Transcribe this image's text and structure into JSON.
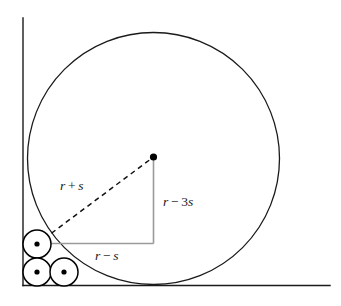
{
  "figure": {
    "background_color": "#ffffff",
    "width": 341,
    "height": 306,
    "axes": {
      "stroke_color": "#1a1a1a",
      "stroke_width": 1.4,
      "vertical": {
        "x": 23,
        "y_top": 18,
        "y_bottom": 285.5
      },
      "horizontal": {
        "y": 285.5,
        "x_left": 23,
        "x_right": 330
      }
    },
    "big_circle": {
      "name": "large-circle",
      "cx": 153.5,
      "cy": 158.5,
      "r": 126,
      "stroke_color": "#1a1a1a",
      "stroke_width": 1.3,
      "fill": "none"
    },
    "big_circle_center_dot": {
      "cx": 153.5,
      "cy": 157,
      "r": 3.6,
      "fill": "#000000"
    },
    "small_circles": [
      {
        "name": "small-circle-upper-left",
        "cx": 37,
        "cy": 244,
        "r": 14,
        "dot_r": 2.6
      },
      {
        "name": "small-circle-lower-left",
        "cx": 37,
        "cy": 272,
        "r": 14,
        "dot_r": 2.6
      },
      {
        "name": "small-circle-lower-right",
        "cx": 64,
        "cy": 272,
        "r": 14,
        "dot_r": 2.6
      }
    ],
    "small_circle_style": {
      "stroke_color": "#000000",
      "stroke_width": 1.5,
      "fill": "#ffffff",
      "dot_fill": "#000000"
    },
    "hypotenuse": {
      "name": "dashed-hypotenuse",
      "x1": 37,
      "y1": 244,
      "x2": 153.5,
      "y2": 157,
      "stroke_color": "#111111",
      "stroke_width": 1.5,
      "dash_pattern": "5,4"
    },
    "triangle_legs": {
      "stroke_color": "#9a9a9a",
      "stroke_width": 1.6,
      "horizontal": {
        "x1": 37,
        "y1": 243.5,
        "x2": 153.5,
        "y2": 243.5
      },
      "vertical": {
        "x1": 153.5,
        "y1": 243.5,
        "x2": 153.5,
        "y2": 157
      }
    },
    "labels": [
      {
        "name": "label-hypotenuse",
        "var1": "r",
        "operator": "+",
        "var2": "s",
        "text": "r + s",
        "x": 60,
        "y": 187,
        "anchor": "start"
      },
      {
        "name": "label-vertical-leg",
        "var1": "r",
        "operator": "−",
        "coefficient": "3",
        "var2": "s",
        "text": "r − 3s",
        "x": 163,
        "y": 203,
        "anchor": "start"
      },
      {
        "name": "label-horizontal-leg",
        "var1": "r",
        "operator": "−",
        "var2": "s",
        "text": "r − s",
        "x": 95,
        "y": 257,
        "anchor": "start"
      }
    ]
  }
}
